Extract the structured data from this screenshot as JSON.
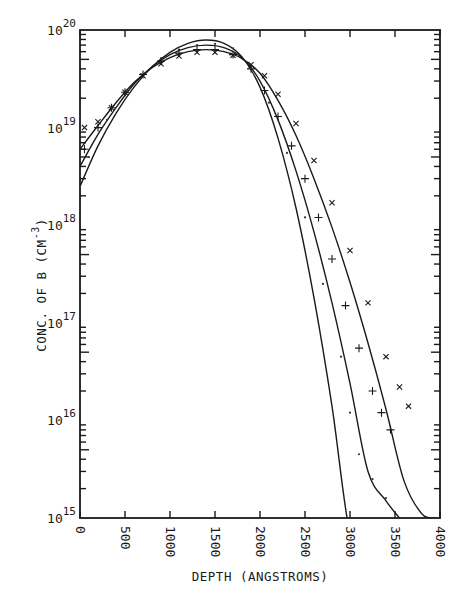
{
  "chart_data": {
    "type": "line",
    "title": "",
    "xlabel": "DEPTH (ANGSTROMS)",
    "ylabel": "CONC. OF B (CM^-3)",
    "ylabel_parts": {
      "main": "CONC. OF B (CM",
      "sup": "-3",
      "close": ")"
    },
    "xscale": "linear",
    "yscale": "log",
    "xlim": [
      0,
      4000
    ],
    "ylim": [
      1000000000000000.0,
      1e+20
    ],
    "x_ticks": [
      0,
      500,
      1000,
      1500,
      2000,
      2500,
      3000,
      3500,
      4000
    ],
    "x_tick_labels": [
      "0",
      "500",
      "1000",
      "1500",
      "2000",
      "2500",
      "3000",
      "3500",
      "4000"
    ],
    "y_ticks": [
      1000000000000000.0,
      1e+16,
      1e+17,
      1e+18,
      1e+19,
      1e+20
    ],
    "y_tick_labels": [
      {
        "base": "10",
        "exp": "15"
      },
      {
        "base": "10",
        "exp": "16"
      },
      {
        "base": "10",
        "exp": "17"
      },
      {
        "base": "10",
        "exp": "18"
      },
      {
        "base": "10",
        "exp": "19"
      },
      {
        "base": "10",
        "exp": "20"
      }
    ],
    "grid": false,
    "legend": null,
    "series": [
      {
        "name": "calculated profile A (solid, highest peak)",
        "style": "solid-line",
        "x": [
          0,
          200,
          400,
          600,
          800,
          1000,
          1200,
          1400,
          1600,
          1800,
          2000,
          2200,
          2400,
          2600,
          2800,
          3000,
          3150
        ],
        "y": [
          2.5e+18,
          6.5e+18,
          1.4e+19,
          2.6e+19,
          4.2e+19,
          5.9e+19,
          7.3e+19,
          7.9e+19,
          7.3e+19,
          5.3e+19,
          2.6e+19,
          7.8e+18,
          1.5e+18,
          1.8e+17,
          1.4e+16,
          700000000000000.0,
          1000000000000000.0
        ]
      },
      {
        "name": "calculated profile B (solid, middle)",
        "style": "solid-line",
        "x": [
          0,
          200,
          400,
          600,
          800,
          1000,
          1200,
          1400,
          1600,
          1800,
          2000,
          2200,
          2400,
          2600,
          2800,
          3000,
          3200,
          3400,
          3550
        ],
        "y": [
          4e+18,
          8.5e+18,
          1.6e+19,
          2.8e+19,
          4.2e+19,
          5.6e+19,
          6.6e+19,
          7e+19,
          6.6e+19,
          5.2e+19,
          3e+19,
          1.2e+19,
          3.6e+18,
          8.5e+17,
          1.6e+17,
          2.4e+16,
          3000000000000000.0,
          1500000000000000.0,
          1000000000000000.0
        ]
      },
      {
        "name": "calculated profile C (solid, widest)",
        "style": "solid-line",
        "x": [
          0,
          200,
          400,
          600,
          800,
          1000,
          1200,
          1400,
          1600,
          1800,
          2000,
          2200,
          2400,
          2600,
          2800,
          3000,
          3200,
          3400,
          3600,
          3800,
          3950
        ],
        "y": [
          6e+18,
          1.05e+19,
          1.8e+19,
          2.9e+19,
          4.1e+19,
          5.2e+19,
          6e+19,
          6.3e+19,
          6e+19,
          5.1e+19,
          3.6e+19,
          1.9e+19,
          8.3e+18,
          3e+18,
          9.5e+17,
          2.6e+17,
          6.2e+16,
          1.3e+16,
          2400000000000000.0,
          1100000000000000.0,
          1000000000000000.0
        ]
      },
      {
        "name": "measured (dots)",
        "style": "dot-marker",
        "x": [
          100,
          300,
          500,
          700,
          900,
          1100,
          1300,
          1500,
          1700,
          1900,
          2100,
          2300,
          2500,
          2700,
          2900,
          3000,
          3100,
          3250,
          3400
        ],
        "y": [
          5e+18,
          1.2e+19,
          2.2e+19,
          3.5e+19,
          5e+19,
          6.3e+19,
          7e+19,
          7.2e+19,
          6.5e+19,
          4.3e+19,
          1.8e+19,
          5.5e+18,
          1.2e+18,
          2.5e+17,
          4.5e+16,
          1.2e+16,
          4500000000000000.0,
          2500000000000000.0,
          1600000000000000.0
        ]
      },
      {
        "name": "measured (+)",
        "style": "plus-marker",
        "x": [
          50,
          200,
          350,
          500,
          700,
          900,
          1100,
          1300,
          1500,
          1700,
          1900,
          2050,
          2200,
          2350,
          2500,
          2650,
          2800,
          2950,
          3100,
          3250,
          3350,
          3450
        ],
        "y": [
          6e+18,
          1e+19,
          1.6e+19,
          2.3e+19,
          3.5e+19,
          4.8e+19,
          5.8e+19,
          6.3e+19,
          6.3e+19,
          5.6e+19,
          4e+19,
          2.4e+19,
          1.3e+19,
          6.5e+18,
          3e+18,
          1.2e+18,
          4.5e+17,
          1.5e+17,
          5.5e+16,
          2e+16,
          1.2e+16,
          8000000000000000.0
        ]
      },
      {
        "name": "measured (x)",
        "style": "x-marker",
        "x": [
          50,
          200,
          350,
          500,
          700,
          900,
          1100,
          1300,
          1500,
          1700,
          1900,
          2050,
          2200,
          2400,
          2600,
          2800,
          3000,
          3200,
          3400,
          3550,
          3650
        ],
        "y": [
          1e+19,
          1.15e+19,
          1.6e+19,
          2.3e+19,
          3.4e+19,
          4.5e+19,
          5.4e+19,
          5.9e+19,
          5.9e+19,
          5.5e+19,
          4.4e+19,
          3.4e+19,
          2.2e+19,
          1.1e+19,
          4.6e+18,
          1.7e+18,
          5.5e+17,
          1.6e+17,
          4.5e+16,
          2.2e+16,
          1.4e+16
        ]
      }
    ]
  }
}
